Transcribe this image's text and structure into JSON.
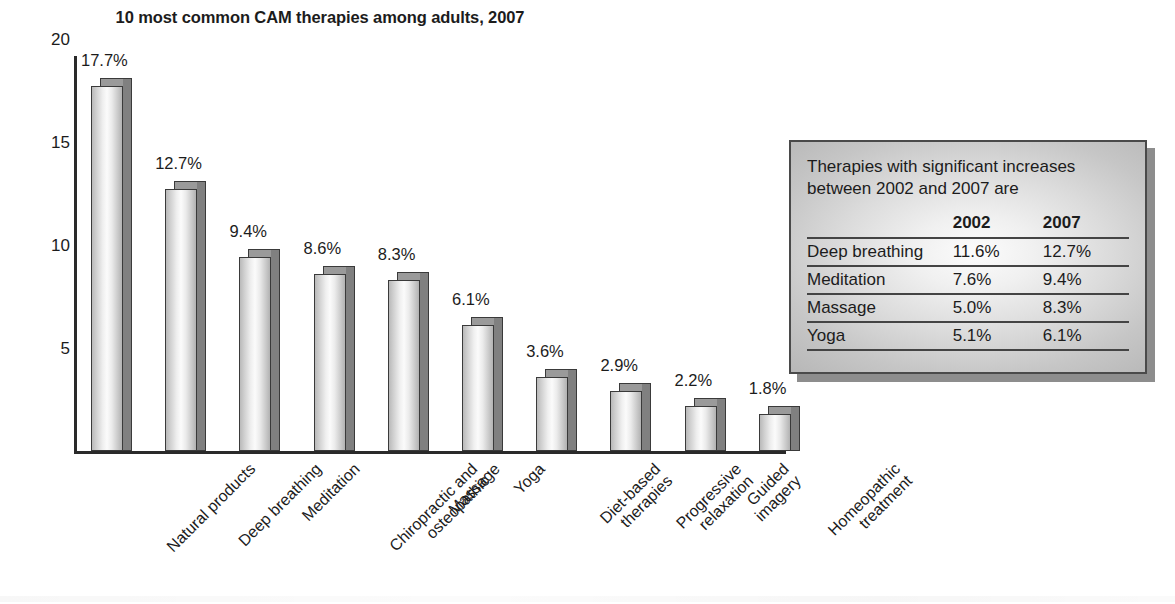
{
  "chart_data": {
    "type": "bar",
    "title": "10 most common CAM therapies among adults, 2007",
    "xlabel": "",
    "ylabel": "",
    "ylim": [
      0,
      20
    ],
    "yticks": [
      20,
      15,
      10,
      5
    ],
    "grid": false,
    "legend": "none",
    "value_suffix": "%",
    "categories": [
      "Natural products",
      "Deep breathing",
      "Meditation",
      "Chiropractic and\nosteopathic",
      "Massage",
      "Yoga",
      "Diet-based\ntherapies",
      "Progressive\nrelaxation",
      "Guided\nimagery",
      "Homeopathic\ntreatment"
    ],
    "values": [
      17.7,
      12.7,
      9.4,
      8.6,
      8.3,
      6.1,
      3.6,
      2.9,
      2.2,
      1.8
    ],
    "data_labels": [
      "17.7%",
      "12.7%",
      "9.4%",
      "8.6%",
      "8.3%",
      "6.1%",
      "3.6%",
      "2.9%",
      "2.2%",
      "1.8%"
    ]
  },
  "callout": {
    "heading": "Therapies with significant increases\nbetween 2002 and 2007 are",
    "columns": [
      "",
      "2002",
      "2007"
    ],
    "rows": [
      {
        "name": "Deep breathing",
        "v2002": "11.6%",
        "v2007": "12.7%"
      },
      {
        "name": "Meditation",
        "v2002": "7.6%",
        "v2007": "9.4%"
      },
      {
        "name": "Massage",
        "v2002": "5.0%",
        "v2007": "8.3%"
      },
      {
        "name": "Yoga",
        "v2002": "5.1%",
        "v2007": "6.1%"
      }
    ]
  },
  "colors": {
    "axis": "#2a2a2a",
    "bar_outline": "#3a3a3a",
    "bar_side": "#808080",
    "text": "#1c1c1c",
    "callout_border": "#4a4a4a",
    "callout_shadow": "#8d8d8d"
  }
}
